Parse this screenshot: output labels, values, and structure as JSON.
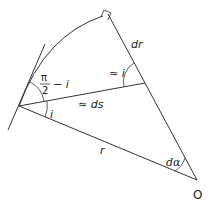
{
  "diagram": {
    "type": "geometry",
    "stroke_color": "#333333",
    "labels": {
      "dr": "dr",
      "approx_i": "≈ i",
      "pi": "π",
      "two": "2",
      "minus_i": "− i",
      "approx_ds": "≈ ds",
      "i": "i",
      "r": "r",
      "dalpha": "dα",
      "origin": "O"
    },
    "points": {
      "O": [
        197,
        180
      ],
      "P": [
        19,
        106
      ],
      "top_corner": [
        108,
        14
      ],
      "ds_end": [
        145,
        83
      ]
    }
  }
}
